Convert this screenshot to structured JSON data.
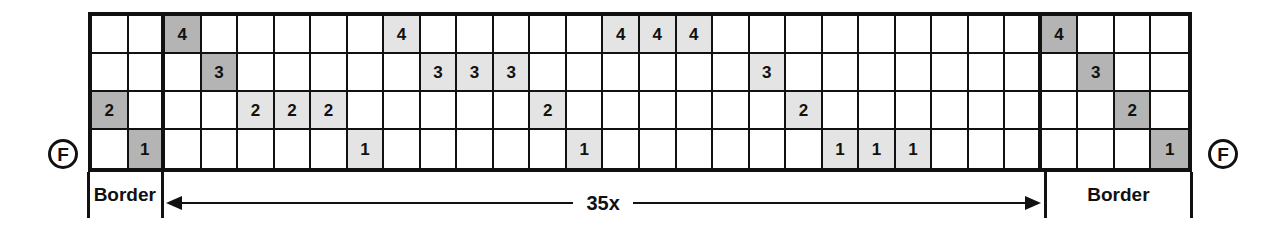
{
  "diagram": {
    "rows": 4,
    "shaft_labels": [
      "4",
      "3",
      "2",
      "1"
    ],
    "markers": {
      "left_frame_label": "F",
      "right_frame_label": "F"
    },
    "sections": [
      {
        "id": "left-border",
        "label": "Border",
        "columns": 2,
        "fill": "dark"
      },
      {
        "id": "repeat",
        "label": "35x",
        "columns": 24,
        "fill": "light"
      },
      {
        "id": "right-border",
        "label": "Border",
        "columns": 4,
        "fill": "dark"
      }
    ],
    "repeat_label": "35x",
    "colors": {
      "ink": "#111111",
      "fill_border": "#b4b4b4",
      "fill_repeat": "#e4e4e4",
      "background": "#ffffff"
    },
    "grid": [
      [
        {
          "v": "",
          "f": "none"
        },
        {
          "v": "",
          "f": "none"
        },
        {
          "v": "4",
          "f": "dark"
        },
        {
          "v": "",
          "f": "none"
        },
        {
          "v": "",
          "f": "none"
        },
        {
          "v": "",
          "f": "none"
        },
        {
          "v": "",
          "f": "none"
        },
        {
          "v": "",
          "f": "none"
        },
        {
          "v": "4",
          "f": "light"
        },
        {
          "v": "",
          "f": "none"
        },
        {
          "v": "",
          "f": "none"
        },
        {
          "v": "",
          "f": "none"
        },
        {
          "v": "",
          "f": "none"
        },
        {
          "v": "",
          "f": "none"
        },
        {
          "v": "4",
          "f": "light"
        },
        {
          "v": "4",
          "f": "light"
        },
        {
          "v": "4",
          "f": "light"
        },
        {
          "v": "",
          "f": "none"
        },
        {
          "v": "",
          "f": "none"
        },
        {
          "v": "",
          "f": "none"
        },
        {
          "v": "",
          "f": "none"
        },
        {
          "v": "",
          "f": "none"
        },
        {
          "v": "",
          "f": "none"
        },
        {
          "v": "",
          "f": "none"
        },
        {
          "v": "",
          "f": "none"
        },
        {
          "v": "",
          "f": "none"
        },
        {
          "v": "4",
          "f": "dark"
        },
        {
          "v": "",
          "f": "none"
        },
        {
          "v": "",
          "f": "none"
        },
        {
          "v": "",
          "f": "none"
        }
      ],
      [
        {
          "v": "",
          "f": "none"
        },
        {
          "v": "",
          "f": "none"
        },
        {
          "v": "",
          "f": "none"
        },
        {
          "v": "3",
          "f": "dark"
        },
        {
          "v": "",
          "f": "none"
        },
        {
          "v": "",
          "f": "none"
        },
        {
          "v": "",
          "f": "none"
        },
        {
          "v": "",
          "f": "none"
        },
        {
          "v": "",
          "f": "none"
        },
        {
          "v": "3",
          "f": "light"
        },
        {
          "v": "3",
          "f": "light"
        },
        {
          "v": "3",
          "f": "light"
        },
        {
          "v": "",
          "f": "none"
        },
        {
          "v": "",
          "f": "none"
        },
        {
          "v": "",
          "f": "none"
        },
        {
          "v": "",
          "f": "none"
        },
        {
          "v": "",
          "f": "none"
        },
        {
          "v": "",
          "f": "none"
        },
        {
          "v": "3",
          "f": "light"
        },
        {
          "v": "",
          "f": "none"
        },
        {
          "v": "",
          "f": "none"
        },
        {
          "v": "",
          "f": "none"
        },
        {
          "v": "",
          "f": "none"
        },
        {
          "v": "",
          "f": "none"
        },
        {
          "v": "",
          "f": "none"
        },
        {
          "v": "",
          "f": "none"
        },
        {
          "v": "",
          "f": "none"
        },
        {
          "v": "3",
          "f": "dark"
        },
        {
          "v": "",
          "f": "none"
        },
        {
          "v": "",
          "f": "none"
        }
      ],
      [
        {
          "v": "2",
          "f": "dark"
        },
        {
          "v": "",
          "f": "none"
        },
        {
          "v": "",
          "f": "none"
        },
        {
          "v": "",
          "f": "none"
        },
        {
          "v": "2",
          "f": "light"
        },
        {
          "v": "2",
          "f": "light"
        },
        {
          "v": "2",
          "f": "light"
        },
        {
          "v": "",
          "f": "none"
        },
        {
          "v": "",
          "f": "none"
        },
        {
          "v": "",
          "f": "none"
        },
        {
          "v": "",
          "f": "none"
        },
        {
          "v": "",
          "f": "none"
        },
        {
          "v": "2",
          "f": "light"
        },
        {
          "v": "",
          "f": "none"
        },
        {
          "v": "",
          "f": "none"
        },
        {
          "v": "",
          "f": "none"
        },
        {
          "v": "",
          "f": "none"
        },
        {
          "v": "",
          "f": "none"
        },
        {
          "v": "",
          "f": "none"
        },
        {
          "v": "2",
          "f": "light"
        },
        {
          "v": "",
          "f": "none"
        },
        {
          "v": "",
          "f": "none"
        },
        {
          "v": "",
          "f": "none"
        },
        {
          "v": "",
          "f": "none"
        },
        {
          "v": "",
          "f": "none"
        },
        {
          "v": "",
          "f": "none"
        },
        {
          "v": "",
          "f": "none"
        },
        {
          "v": "",
          "f": "none"
        },
        {
          "v": "2",
          "f": "dark"
        },
        {
          "v": "",
          "f": "none"
        }
      ],
      [
        {
          "v": "",
          "f": "none"
        },
        {
          "v": "1",
          "f": "dark"
        },
        {
          "v": "",
          "f": "none"
        },
        {
          "v": "",
          "f": "none"
        },
        {
          "v": "",
          "f": "none"
        },
        {
          "v": "",
          "f": "none"
        },
        {
          "v": "",
          "f": "none"
        },
        {
          "v": "1",
          "f": "light"
        },
        {
          "v": "",
          "f": "none"
        },
        {
          "v": "",
          "f": "none"
        },
        {
          "v": "",
          "f": "none"
        },
        {
          "v": "",
          "f": "none"
        },
        {
          "v": "",
          "f": "none"
        },
        {
          "v": "1",
          "f": "light"
        },
        {
          "v": "",
          "f": "none"
        },
        {
          "v": "",
          "f": "none"
        },
        {
          "v": "",
          "f": "none"
        },
        {
          "v": "",
          "f": "none"
        },
        {
          "v": "",
          "f": "none"
        },
        {
          "v": "",
          "f": "none"
        },
        {
          "v": "1",
          "f": "light"
        },
        {
          "v": "1",
          "f": "light"
        },
        {
          "v": "1",
          "f": "light"
        },
        {
          "v": "",
          "f": "none"
        },
        {
          "v": "",
          "f": "none"
        },
        {
          "v": "",
          "f": "none"
        },
        {
          "v": "",
          "f": "none"
        },
        {
          "v": "",
          "f": "none"
        },
        {
          "v": "",
          "f": "none"
        },
        {
          "v": "1",
          "f": "dark"
        }
      ]
    ]
  }
}
